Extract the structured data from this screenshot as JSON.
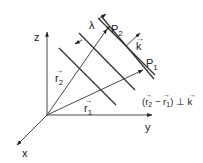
{
  "diagram": {
    "axes": {
      "x": "x",
      "y": "y",
      "z": "z"
    },
    "vectors": {
      "r1": {
        "label": "r",
        "subscript": "1"
      },
      "r2": {
        "label": "r",
        "subscript": "2"
      },
      "k": {
        "label": "k"
      }
    },
    "points": {
      "p1": {
        "label": "P",
        "subscript": "1"
      },
      "p2": {
        "label": "P",
        "subscript": "2"
      }
    },
    "wavelength_label": "λ",
    "relation": {
      "open": "(",
      "r2": "r",
      "r2_sub": "2",
      "minus": " − ",
      "r1": "r",
      "r1_sub": "1",
      "close": ")",
      "perp": " ⊥ ",
      "k": "k"
    },
    "wavefront_count": 4,
    "colors": {
      "line": "#333333",
      "background": "#ffffff"
    }
  }
}
